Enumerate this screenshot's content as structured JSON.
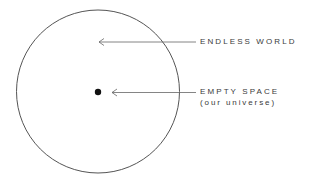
{
  "diagram": {
    "outer_circle": {
      "label": "ENDLESS WORLD"
    },
    "center_dot": {
      "label": "EMPTY SPACE",
      "sublabel": "(our universe)"
    }
  },
  "colors": {
    "stroke": "#555555",
    "text": "#3a3a3a",
    "dot": "#111111",
    "background": "#ffffff"
  }
}
